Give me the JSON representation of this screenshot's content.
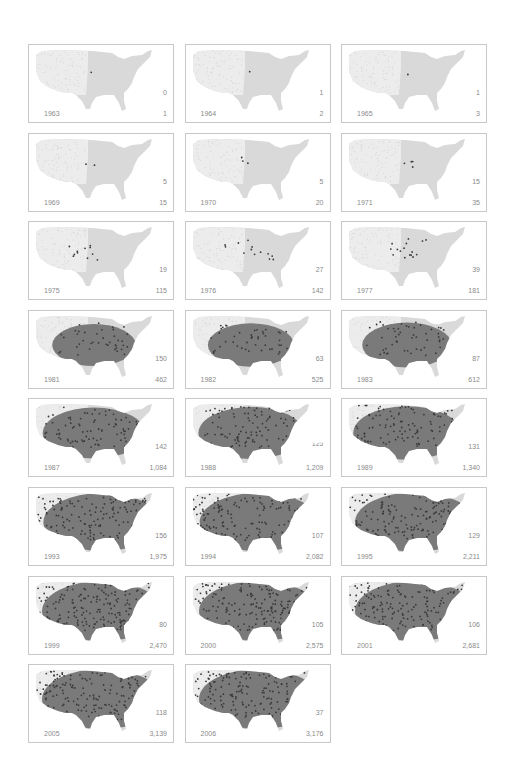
{
  "colors": {
    "map_fill_east": "#d9d9d9",
    "map_fill_west": "#ececec",
    "dot_west": "#e2e2e2",
    "infected": "#3a3a3a",
    "infected_area": "#7a7a7a",
    "label_text": "#8a8a8a",
    "panel_border": "#c8c8c8"
  },
  "chart_data": {
    "type": "small-multiples-map",
    "title": "",
    "panels": [
      {
        "year": "1963",
        "new": "0",
        "total": "1"
      },
      {
        "year": "1964",
        "new": "1",
        "total": "2"
      },
      {
        "year": "1965",
        "new": "1",
        "total": "3"
      },
      {
        "year": "1969",
        "new": "5",
        "total": "15"
      },
      {
        "year": "1970",
        "new": "5",
        "total": "20"
      },
      {
        "year": "1971",
        "new": "15",
        "total": "35"
      },
      {
        "year": "1975",
        "new": "19",
        "total": "115"
      },
      {
        "year": "1976",
        "new": "27",
        "total": "142"
      },
      {
        "year": "1977",
        "new": "39",
        "total": "181"
      },
      {
        "year": "1981",
        "new": "150",
        "total": "462"
      },
      {
        "year": "1982",
        "new": "63",
        "total": "525"
      },
      {
        "year": "1983",
        "new": "87",
        "total": "612"
      },
      {
        "year": "1987",
        "new": "142",
        "total": "1,084"
      },
      {
        "year": "1988",
        "new": "125",
        "total": "1,209"
      },
      {
        "year": "1989",
        "new": "131",
        "total": "1,340"
      },
      {
        "year": "1993",
        "new": "156",
        "total": "1,975"
      },
      {
        "year": "1994",
        "new": "107",
        "total": "2,082"
      },
      {
        "year": "1995",
        "new": "129",
        "total": "2,211"
      },
      {
        "year": "1999",
        "new": "80",
        "total": "2,470"
      },
      {
        "year": "2000",
        "new": "105",
        "total": "2,575"
      },
      {
        "year": "2001",
        "new": "106",
        "total": "2,681"
      },
      {
        "year": "2005",
        "new": "118",
        "total": "3,139"
      },
      {
        "year": "2006",
        "new": "37",
        "total": "3,176"
      }
    ],
    "series": [
      {
        "name": "new",
        "x": [
          1963,
          1964,
          1965,
          1969,
          1970,
          1971,
          1975,
          1976,
          1977,
          1981,
          1982,
          1983,
          1987,
          1988,
          1989,
          1993,
          1994,
          1995,
          1999,
          2000,
          2001,
          2005,
          2006
        ],
        "values": [
          0,
          1,
          1,
          5,
          5,
          15,
          19,
          27,
          39,
          150,
          63,
          87,
          142,
          125,
          131,
          156,
          107,
          129,
          80,
          105,
          106,
          118,
          37
        ]
      },
      {
        "name": "total",
        "x": [
          1963,
          1964,
          1965,
          1969,
          1970,
          1971,
          1975,
          1976,
          1977,
          1981,
          1982,
          1983,
          1987,
          1988,
          1989,
          1993,
          1994,
          1995,
          1999,
          2000,
          2001,
          2005,
          2006
        ],
        "values": [
          1,
          2,
          3,
          15,
          20,
          35,
          115,
          142,
          181,
          462,
          525,
          612,
          1084,
          1209,
          1340,
          1975,
          2082,
          2211,
          2470,
          2575,
          2681,
          3139,
          3176
        ]
      }
    ],
    "layout": {
      "columns": 3,
      "rows": 8,
      "legend": "none",
      "axes": "none"
    }
  }
}
